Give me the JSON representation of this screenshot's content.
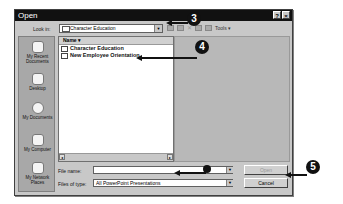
{
  "dialog": {
    "title": "Open",
    "title_buttons": [
      "?",
      "×"
    ],
    "look_in_label": "Look in:",
    "look_in_value": "Character Education",
    "toolbar": {
      "tools_label": "Tools ▾"
    },
    "places": [
      {
        "label": "My Recent Documents"
      },
      {
        "label": "Desktop"
      },
      {
        "label": "My Documents"
      },
      {
        "label": "My Computer"
      },
      {
        "label": "My Network Places"
      }
    ],
    "file_list": {
      "column_header": "Name ▾",
      "items": [
        {
          "name": "Character Education",
          "type": "folder"
        },
        {
          "name": "New Employee Orientation",
          "type": "presentation"
        }
      ]
    },
    "file_name_label": "File name:",
    "file_name_value": "",
    "files_of_type_label": "Files of type:",
    "files_of_type_value": "All PowerPoint Presentations",
    "open_button": "Open",
    "cancel_button": "Cancel"
  },
  "callouts": [
    "3",
    "4",
    "5"
  ]
}
